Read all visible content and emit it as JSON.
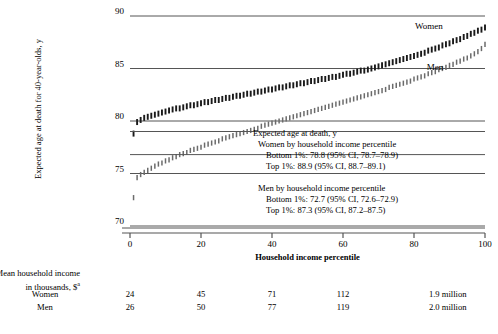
{
  "chart_data": {
    "type": "scatter",
    "title": "",
    "xlabel": "Household income percentile",
    "ylabel": "Expected age at death for 40-year-olds, y",
    "xlim": [
      0,
      100
    ],
    "ylim": [
      70,
      90
    ],
    "xticks": [
      0,
      20,
      40,
      60,
      80,
      100
    ],
    "yticks": [
      70,
      75,
      80,
      85,
      90
    ],
    "grid": true,
    "legend_position": "inline-annotation",
    "series": [
      {
        "name": "Women",
        "marker": "vertical-ci-bar",
        "color": "#1a1a1a",
        "x": [
          1,
          2,
          3,
          4,
          5,
          6,
          7,
          8,
          9,
          10,
          11,
          12,
          13,
          14,
          15,
          16,
          17,
          18,
          19,
          20,
          21,
          22,
          23,
          24,
          25,
          26,
          27,
          28,
          29,
          30,
          31,
          32,
          33,
          34,
          35,
          36,
          37,
          38,
          39,
          40,
          41,
          42,
          43,
          44,
          45,
          46,
          47,
          48,
          49,
          50,
          51,
          52,
          53,
          54,
          55,
          56,
          57,
          58,
          59,
          60,
          61,
          62,
          63,
          64,
          65,
          66,
          67,
          68,
          69,
          70,
          71,
          72,
          73,
          74,
          75,
          76,
          77,
          78,
          79,
          80,
          81,
          82,
          83,
          84,
          85,
          86,
          87,
          88,
          89,
          90,
          91,
          92,
          93,
          94,
          95,
          96,
          97,
          98,
          99,
          100
        ],
        "y": [
          78.8,
          79.9,
          80.1,
          80.3,
          80.4,
          80.5,
          80.6,
          80.7,
          80.8,
          80.9,
          81.0,
          81.1,
          81.2,
          81.2,
          81.3,
          81.4,
          81.5,
          81.5,
          81.6,
          81.7,
          81.8,
          81.8,
          81.9,
          82.0,
          82.0,
          82.1,
          82.2,
          82.2,
          82.3,
          82.4,
          82.4,
          82.5,
          82.6,
          82.6,
          82.7,
          82.8,
          82.8,
          82.9,
          83.0,
          83.0,
          83.1,
          83.2,
          83.2,
          83.3,
          83.4,
          83.4,
          83.5,
          83.6,
          83.6,
          83.7,
          83.8,
          83.8,
          83.9,
          84.0,
          84.0,
          84.1,
          84.2,
          84.2,
          84.3,
          84.4,
          84.5,
          84.5,
          84.6,
          84.7,
          84.8,
          84.8,
          84.9,
          85.0,
          85.1,
          85.2,
          85.3,
          85.4,
          85.5,
          85.6,
          85.7,
          85.8,
          85.9,
          86.0,
          86.1,
          86.2,
          86.3,
          86.4,
          86.5,
          86.7,
          86.8,
          86.9,
          87.0,
          87.2,
          87.3,
          87.4,
          87.6,
          87.7,
          87.8,
          88.0,
          88.1,
          88.3,
          88.4,
          88.6,
          88.7,
          88.9
        ]
      },
      {
        "name": "Men",
        "marker": "vertical-ci-bar",
        "color": "#6b6b6b",
        "x": [
          1,
          2,
          3,
          4,
          5,
          6,
          7,
          8,
          9,
          10,
          11,
          12,
          13,
          14,
          15,
          16,
          17,
          18,
          19,
          20,
          21,
          22,
          23,
          24,
          25,
          26,
          27,
          28,
          29,
          30,
          31,
          32,
          33,
          34,
          35,
          36,
          37,
          38,
          39,
          40,
          41,
          42,
          43,
          44,
          45,
          46,
          47,
          48,
          49,
          50,
          51,
          52,
          53,
          54,
          55,
          56,
          57,
          58,
          59,
          60,
          61,
          62,
          63,
          64,
          65,
          66,
          67,
          68,
          69,
          70,
          71,
          72,
          73,
          74,
          75,
          76,
          77,
          78,
          79,
          80,
          81,
          82,
          83,
          84,
          85,
          86,
          87,
          88,
          89,
          90,
          91,
          92,
          93,
          94,
          95,
          96,
          97,
          98,
          99,
          100
        ],
        "y": [
          72.7,
          74.6,
          74.9,
          75.1,
          75.3,
          75.5,
          75.7,
          75.9,
          76.0,
          76.2,
          76.3,
          76.5,
          76.6,
          76.8,
          76.9,
          77.0,
          77.2,
          77.3,
          77.4,
          77.5,
          77.7,
          77.8,
          77.9,
          78.0,
          78.1,
          78.3,
          78.4,
          78.5,
          78.6,
          78.7,
          78.8,
          78.9,
          79.0,
          79.1,
          79.2,
          79.3,
          79.5,
          79.6,
          79.7,
          79.8,
          79.9,
          80.0,
          80.1,
          80.2,
          80.3,
          80.4,
          80.5,
          80.6,
          80.7,
          80.8,
          80.9,
          81.0,
          81.1,
          81.2,
          81.3,
          81.4,
          81.5,
          81.6,
          81.7,
          81.8,
          81.9,
          82.0,
          82.1,
          82.2,
          82.3,
          82.4,
          82.5,
          82.6,
          82.7,
          82.8,
          82.9,
          83.0,
          83.2,
          83.3,
          83.4,
          83.5,
          83.6,
          83.7,
          83.8,
          84.0,
          84.1,
          84.2,
          84.3,
          84.5,
          84.6,
          84.7,
          84.9,
          85.0,
          85.1,
          85.3,
          85.4,
          85.6,
          85.7,
          85.9,
          86.0,
          86.2,
          86.4,
          86.6,
          86.9,
          87.3
        ]
      }
    ]
  },
  "yaxis": {
    "label": "Expected age at death for 40-year-olds, y",
    "ticks": [
      "90",
      "85",
      "80",
      "75",
      "70"
    ]
  },
  "xaxis": {
    "title": "Household income percentile",
    "ticks": [
      "0",
      "20",
      "40",
      "60",
      "80",
      "100"
    ]
  },
  "series_labels": {
    "women": "Women",
    "men": "Men"
  },
  "annotation": {
    "heading": "Expected age at death, y",
    "women_group": "Women by household income percentile",
    "women_bottom": "Bottom 1%: 78.8 (95% CI, 78.7–78.9)",
    "women_top": "Top 1%: 88.9 (95% CI, 88.7–89.1)",
    "men_group": "Men by household income percentile",
    "men_bottom": "Bottom 1%: 72.7 (95% CI, 72.6–72.9)",
    "men_top": "Top 1%: 87.3 (95% CI, 87.2–87.5)"
  },
  "table": {
    "header_line1": "Mean household income",
    "header_line2_pre": "in thousands, $",
    "header_line2_sup": "a",
    "rows": [
      {
        "label": "Women",
        "values": [
          "24",
          "45",
          "71",
          "112",
          "1.9 million"
        ]
      },
      {
        "label": "Men",
        "values": [
          "26",
          "50",
          "77",
          "119",
          "2.0 million"
        ]
      }
    ]
  },
  "colors": {
    "women": "#1a1a1a",
    "men": "#6b6b6b",
    "axis": "#555555",
    "text": "#000000"
  }
}
